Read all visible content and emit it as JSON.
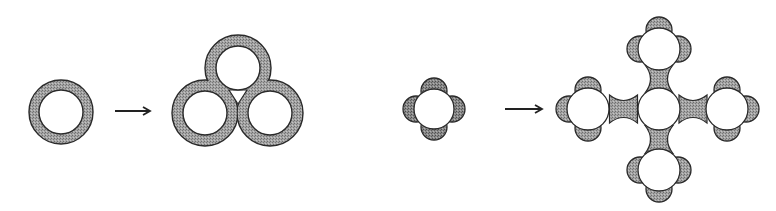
{
  "colors": {
    "background": "#ffffff",
    "ring_fill": "#9a9a9a",
    "lobe_fill": "#a8a8a8",
    "lobe_dark": "#7c7c7c",
    "stroke": "#2a2a2a",
    "hole": "#ffffff"
  },
  "diagram": {
    "left_panel": {
      "input": {
        "shape": "single-ring",
        "cx": 61,
        "cy": 112,
        "r_outer": 32,
        "r_inner": 22
      },
      "arrow": {
        "x1": 115,
        "x2": 150,
        "y": 111
      },
      "output": {
        "shape": "three-fused-rings",
        "rings": [
          {
            "cx": 238,
            "cy": 68,
            "r_outer": 33,
            "r_inner": 22
          },
          {
            "cx": 205,
            "cy": 113,
            "r_outer": 33,
            "r_inner": 22
          },
          {
            "cx": 270,
            "cy": 113,
            "r_outer": 33,
            "r_inner": 22
          }
        ]
      }
    },
    "right_panel": {
      "input": {
        "shape": "atom-with-four-lobes",
        "cx": 434,
        "cy": 109,
        "r": 20,
        "lobe_r": 13
      },
      "arrow": {
        "x1": 505,
        "x2": 542,
        "y": 109
      },
      "output": {
        "shape": "cross-of-five-atoms",
        "atoms": [
          {
            "role": "center",
            "cx": 659,
            "cy": 109
          },
          {
            "role": "left",
            "cx": 588,
            "cy": 109
          },
          {
            "role": "right",
            "cx": 727,
            "cy": 109
          },
          {
            "role": "top",
            "cx": 659,
            "cy": 49
          },
          {
            "role": "bottom",
            "cx": 659,
            "cy": 170
          }
        ],
        "atom_r": 21,
        "lobe_r": 13
      }
    }
  }
}
